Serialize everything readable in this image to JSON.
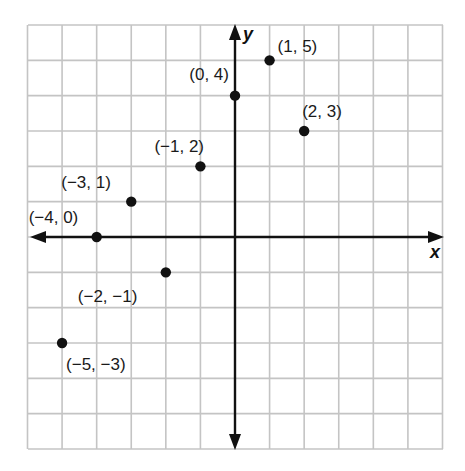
{
  "figure": {
    "title": "",
    "x_axis_label": "x",
    "y_axis_label": "y"
  },
  "colors": {
    "grid": "#c4c4c4",
    "axis": "#111111",
    "point": "#111111",
    "background": "#ffffff"
  },
  "points": [
    {
      "label": "(1, 5)",
      "x": 1,
      "y": 5
    },
    {
      "label": "(0, 4)",
      "x": 0,
      "y": 4
    },
    {
      "label": "(2, 3)",
      "x": 2,
      "y": 3
    },
    {
      "label": "(−1, 2)",
      "x": -1,
      "y": 2
    },
    {
      "label": "(−3, 1)",
      "x": -3,
      "y": 1
    },
    {
      "label": "(−4, 0)",
      "x": -4,
      "y": 0
    },
    {
      "label": "(−2, −1)",
      "x": -2,
      "y": -1
    },
    {
      "label": "(−5, −3)",
      "x": -5,
      "y": -3
    }
  ],
  "chart_data": {
    "type": "scatter",
    "title": "",
    "xlabel": "x",
    "ylabel": "y",
    "xlim": [
      -6,
      6
    ],
    "ylim": [
      -6,
      6
    ],
    "grid": true,
    "legend": null,
    "x": [
      1,
      0,
      2,
      -1,
      -3,
      -4,
      -2,
      -5
    ],
    "y": [
      5,
      4,
      3,
      2,
      1,
      0,
      -1,
      -3
    ],
    "annotations": [
      "(1, 5)",
      "(0, 4)",
      "(2, 3)",
      "(−1, 2)",
      "(−3, 1)",
      "(−4, 0)",
      "(−2, −1)",
      "(−5, −3)"
    ]
  }
}
